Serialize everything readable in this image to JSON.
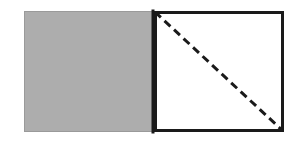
{
  "figure": {
    "canvas": {
      "width": 296,
      "height": 146,
      "background_color": "#ffffff"
    },
    "shapes": {
      "left_square": {
        "name": "shaded-square",
        "x": 24,
        "y": 11,
        "width": 130,
        "height": 121,
        "fill_color": "#adadad",
        "stroke_color": "#9a9a9a",
        "stroke_width": 1
      },
      "right_square": {
        "name": "open-square",
        "x": 154,
        "y": 11,
        "width": 130,
        "height": 121,
        "fill_color": "#ffffff",
        "stroke_color": "#1a1a1a",
        "stroke_width": 3
      },
      "divider_line": {
        "name": "shared-edge",
        "x1": 153,
        "y1": 11,
        "x2": 153,
        "y2": 132,
        "stroke_color": "#1a1a1a",
        "stroke_width": 3
      },
      "diagonal": {
        "name": "dashed-diagonal",
        "x1": 155,
        "y1": 12,
        "x2": 283,
        "y2": 131,
        "stroke_color": "#1a1a1a",
        "stroke_width": 3,
        "dash_length": 8,
        "gap_length": 5,
        "style": "dashed",
        "direction": "top-left to bottom-right"
      }
    }
  }
}
